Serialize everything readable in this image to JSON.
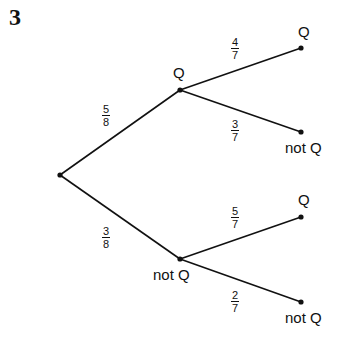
{
  "question_number": "3",
  "tree": {
    "first": [
      {
        "label": "Q",
        "prob_num": "5",
        "prob_den": "8"
      },
      {
        "label": "not Q",
        "prob_num": "3",
        "prob_den": "8"
      }
    ],
    "second_after_Q": [
      {
        "label": "Q",
        "prob_num": "4",
        "prob_den": "7"
      },
      {
        "label": "not Q",
        "prob_num": "3",
        "prob_den": "7"
      }
    ],
    "second_after_notQ": [
      {
        "label": "Q",
        "prob_num": "5",
        "prob_den": "7"
      },
      {
        "label": "not Q",
        "prob_num": "2",
        "prob_den": "7"
      }
    ]
  }
}
